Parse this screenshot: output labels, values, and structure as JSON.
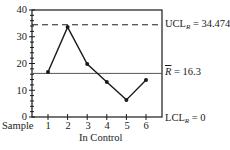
{
  "chart_data": {
    "type": "line",
    "title": "",
    "xlabel": "In Control",
    "ylabel": "",
    "x_prefix_label": "Sample",
    "categories": [
      "1",
      "2",
      "3",
      "4",
      "5",
      "6"
    ],
    "x": [
      1,
      2,
      3,
      4,
      5,
      6
    ],
    "series": [
      {
        "name": "Sample Range (R)",
        "values": [
          16.8,
          33.6,
          19.8,
          13.1,
          6.4,
          13.8
        ],
        "markers": true,
        "color": "#1a1a1a"
      }
    ],
    "reference_lines": [
      {
        "name": "UCL_R",
        "label_main": "UCL",
        "label_sub": "R",
        "label_value": " = 34.4745",
        "value": 34.4745,
        "style": "dashed"
      },
      {
        "name": "R_bar",
        "label_main": "R",
        "label_value": " = 16.3",
        "value": 16.3,
        "style": "solid"
      },
      {
        "name": "LCL_R",
        "label_main": "LCL",
        "label_sub": "R",
        "label_value": " = 0",
        "value": 0,
        "style": "axis"
      }
    ],
    "yticks": [
      0,
      10,
      20,
      30,
      40
    ],
    "ylim": [
      0,
      40
    ],
    "xlim": [
      0.2,
      6.8
    ],
    "grid": false,
    "legend": "none"
  },
  "labels": {
    "sample": "Sample",
    "in_control": "In Control",
    "ucl_main": "UCL",
    "ucl_sub": "R",
    "ucl_value": " = 34.4745",
    "rbar_main": "R",
    "rbar_value": " = 16.3",
    "lcl_main": "LCL",
    "lcl_sub": "R",
    "lcl_value": " = 0",
    "ytick_0": "0",
    "ytick_10": "10",
    "ytick_20": "20",
    "ytick_30": "30",
    "ytick_40": "40",
    "xtick_1": "1",
    "xtick_2": "2",
    "xtick_3": "3",
    "xtick_4": "4",
    "xtick_5": "5",
    "xtick_6": "6"
  },
  "colors": {
    "ink": "#1a1a1a",
    "reference": "#555555",
    "background": "#ffffff"
  }
}
